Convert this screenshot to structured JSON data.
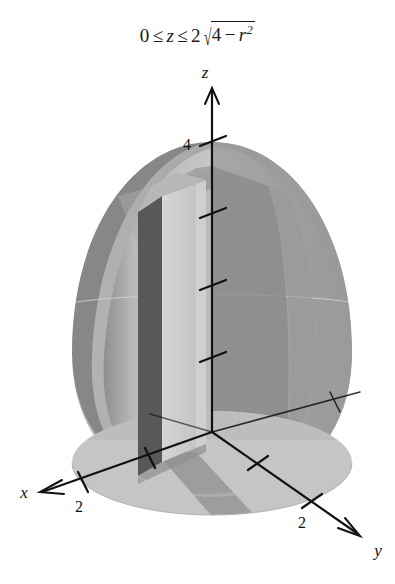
{
  "figure": {
    "caption": {
      "lower_bound": "0",
      "rel1": "≤",
      "variable": "z",
      "rel2": "≤",
      "coefficient": "2",
      "radical_sign": "√",
      "radicand_a": "4",
      "radicand_op": "−",
      "radicand_var": "r",
      "radicand_exp": "2",
      "full_text": "0 ≤ z ≤ 2√(4 − r²)"
    },
    "axes": {
      "z": {
        "label": "z",
        "tick_labels": [
          "4"
        ],
        "tick_values": [
          1,
          2,
          3,
          4
        ],
        "max_shown": 4
      },
      "x": {
        "label": "x",
        "tick_labels": [
          "2"
        ],
        "tick_values": [
          2
        ]
      },
      "y": {
        "label": "y",
        "tick_labels": [
          "2"
        ],
        "tick_values": [
          1,
          2
        ]
      }
    },
    "solid": {
      "name": "semi-ellipsoid-dome",
      "equation": "z = 2√(4 - r²)",
      "radius": 2,
      "height": 4,
      "slab": {
        "name": "vertical-slab-element",
        "description": "rectangular volume element"
      }
    },
    "colors": {
      "background": "#ffffff",
      "surface_light": "#c9c9c9",
      "surface_mid": "#ababab",
      "surface_dark": "#8e8e8e",
      "surface_rim": "#7e7e7e",
      "base_disk": "#c4c4c4",
      "base_strip": "#9a9a9a",
      "slab_front": "#d2d2d2",
      "slab_side": "#5a5a5a",
      "slab_top": "#bfbfbf",
      "axis_line": "#111111",
      "text": "#111111"
    }
  }
}
